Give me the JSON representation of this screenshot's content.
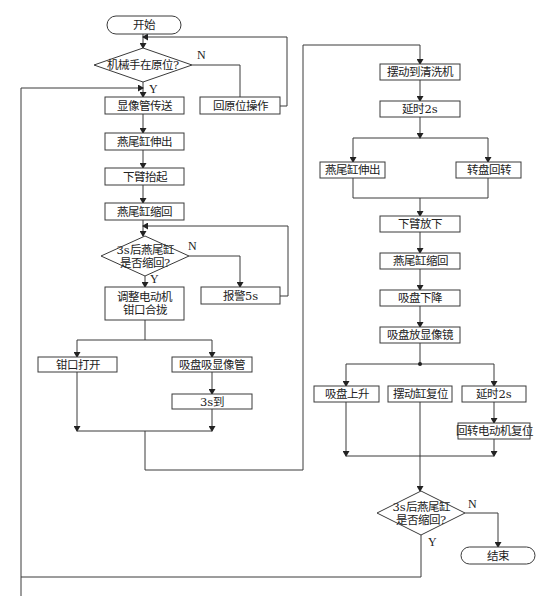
{
  "diagram": {
    "type": "flowchart",
    "colors": {
      "stroke": "#3a3a3a",
      "fill": "#ffffff",
      "text": "#222222"
    },
    "nodes": [
      {
        "id": "start",
        "shape": "terminal",
        "text": [
          "开始"
        ],
        "x": 107,
        "y": 16,
        "w": 74,
        "h": 18
      },
      {
        "id": "d1",
        "shape": "diamond",
        "text": [
          "机械手在原位?"
        ],
        "cx": 143,
        "cy": 65,
        "w": 98,
        "h": 34
      },
      {
        "id": "n_return",
        "shape": "rect",
        "text": [
          "回原位操作"
        ],
        "x": 200,
        "y": 97,
        "w": 80,
        "h": 17
      },
      {
        "id": "n1",
        "shape": "rect",
        "text": [
          "显像管传送"
        ],
        "x": 105,
        "y": 97,
        "w": 79,
        "h": 17
      },
      {
        "id": "n2",
        "shape": "rect",
        "text": [
          "燕尾缸伸出"
        ],
        "x": 105,
        "y": 133,
        "w": 79,
        "h": 17
      },
      {
        "id": "n3",
        "shape": "rect",
        "text": [
          "下臂抬起"
        ],
        "x": 105,
        "y": 168,
        "w": 79,
        "h": 17
      },
      {
        "id": "n4",
        "shape": "rect",
        "text": [
          "燕尾缸缩回"
        ],
        "x": 105,
        "y": 203,
        "w": 79,
        "h": 17
      },
      {
        "id": "d2",
        "shape": "diamond",
        "text": [
          "3s后燕尾缸",
          "是否缩回?"
        ],
        "cx": 145,
        "cy": 256,
        "w": 88,
        "h": 40
      },
      {
        "id": "n_alarm",
        "shape": "rect",
        "text": [
          "报警5s"
        ],
        "x": 201,
        "y": 287,
        "w": 79,
        "h": 17
      },
      {
        "id": "n5",
        "shape": "rect",
        "text": [
          "调整电动机",
          "钳口合拢"
        ],
        "x": 105,
        "y": 287,
        "w": 79,
        "h": 33
      },
      {
        "id": "n6",
        "shape": "rect",
        "text": [
          "钳口打开"
        ],
        "x": 38,
        "y": 357,
        "w": 79,
        "h": 15
      },
      {
        "id": "n7",
        "shape": "rect",
        "text": [
          "吸盘吸显像管"
        ],
        "x": 172,
        "y": 357,
        "w": 80,
        "h": 15
      },
      {
        "id": "n8",
        "shape": "rect",
        "text": [
          "3s到"
        ],
        "x": 172,
        "y": 394,
        "w": 80,
        "h": 15
      },
      {
        "id": "r1",
        "shape": "rect",
        "text": [
          "摆动到清洗机"
        ],
        "x": 380,
        "y": 64,
        "w": 80,
        "h": 16
      },
      {
        "id": "r2",
        "shape": "rect",
        "text": [
          "延时2s"
        ],
        "x": 380,
        "y": 101,
        "w": 80,
        "h": 16
      },
      {
        "id": "r3",
        "shape": "rect",
        "text": [
          "燕尾缸伸出"
        ],
        "x": 320,
        "y": 162,
        "w": 65,
        "h": 16
      },
      {
        "id": "r4",
        "shape": "rect",
        "text": [
          "转盘回转"
        ],
        "x": 456,
        "y": 162,
        "w": 65,
        "h": 16
      },
      {
        "id": "r5",
        "shape": "rect",
        "text": [
          "下臂放下"
        ],
        "x": 380,
        "y": 216,
        "w": 80,
        "h": 16
      },
      {
        "id": "r6",
        "shape": "rect",
        "text": [
          "燕尾缸缩回"
        ],
        "x": 380,
        "y": 253,
        "w": 80,
        "h": 16
      },
      {
        "id": "r7",
        "shape": "rect",
        "text": [
          "吸盘下降"
        ],
        "x": 380,
        "y": 290,
        "w": 80,
        "h": 16
      },
      {
        "id": "r8",
        "shape": "rect",
        "text": [
          "吸盘放显像镜"
        ],
        "x": 380,
        "y": 327,
        "w": 80,
        "h": 16
      },
      {
        "id": "r9",
        "shape": "rect",
        "text": [
          "吸盘上升"
        ],
        "x": 314,
        "y": 386,
        "w": 65,
        "h": 16
      },
      {
        "id": "r10",
        "shape": "rect",
        "text": [
          "摆动缸复位"
        ],
        "x": 388,
        "y": 386,
        "w": 64,
        "h": 16
      },
      {
        "id": "r11",
        "shape": "rect",
        "text": [
          "延时2s"
        ],
        "x": 462,
        "y": 386,
        "w": 64,
        "h": 16
      },
      {
        "id": "r12",
        "shape": "rect",
        "text": [
          "回转电动机复位"
        ],
        "x": 458,
        "y": 423,
        "w": 72,
        "h": 16
      },
      {
        "id": "d3",
        "shape": "diamond",
        "text": [
          "3s后燕尾缸",
          "是否缩回?"
        ],
        "cx": 421,
        "cy": 513,
        "w": 88,
        "h": 44
      },
      {
        "id": "end",
        "shape": "terminal",
        "text": [
          "结束"
        ],
        "x": 461,
        "y": 547,
        "w": 74,
        "h": 17
      }
    ],
    "branch_labels": [
      {
        "text": "N",
        "x": 197,
        "y": 59
      },
      {
        "text": "Y",
        "x": 149,
        "y": 93
      },
      {
        "text": "N",
        "x": 188,
        "y": 250
      },
      {
        "text": "Y",
        "x": 150,
        "y": 283
      },
      {
        "text": "N",
        "x": 468,
        "y": 508
      },
      {
        "text": "Y",
        "x": 428,
        "y": 546
      }
    ],
    "edges": [
      {
        "points": [
          [
            143,
            34
          ],
          [
            143,
            48
          ]
        ],
        "arrow": true
      },
      {
        "points": [
          [
            192,
            65
          ],
          [
            240,
            65
          ],
          [
            240,
            97
          ]
        ],
        "arrow": false
      },
      {
        "points": [
          [
            280,
            106
          ],
          [
            287,
            106
          ],
          [
            287,
            37
          ],
          [
            143,
            37
          ]
        ],
        "arrow": true
      },
      {
        "points": [
          [
            143,
            82
          ],
          [
            143,
            97
          ]
        ],
        "arrow": true
      },
      {
        "points": [
          [
            21,
            596
          ],
          [
            21,
            88
          ],
          [
            143,
            88
          ]
        ],
        "arrow": true,
        "note": "loop from final Y"
      },
      {
        "points": [
          [
            143,
            114
          ],
          [
            143,
            133
          ]
        ],
        "arrow": true
      },
      {
        "points": [
          [
            143,
            150
          ],
          [
            143,
            168
          ]
        ],
        "arrow": true
      },
      {
        "points": [
          [
            143,
            185
          ],
          [
            143,
            203
          ]
        ],
        "arrow": true
      },
      {
        "points": [
          [
            143,
            220
          ],
          [
            143,
            236
          ]
        ],
        "arrow": true
      },
      {
        "points": [
          [
            189,
            256
          ],
          [
            240,
            256
          ],
          [
            240,
            287
          ]
        ],
        "arrow": true
      },
      {
        "points": [
          [
            280,
            296
          ],
          [
            288,
            296
          ],
          [
            288,
            226
          ],
          [
            143,
            226
          ]
        ],
        "arrow": true
      },
      {
        "points": [
          [
            145,
            276
          ],
          [
            145,
            287
          ]
        ],
        "arrow": true
      },
      {
        "points": [
          [
            145,
            320
          ],
          [
            145,
            340
          ]
        ],
        "arrow": false
      },
      {
        "points": [
          [
            77,
            340
          ],
          [
            212,
            340
          ]
        ],
        "arrow": false
      },
      {
        "points": [
          [
            77,
            340
          ],
          [
            77,
            357
          ]
        ],
        "arrow": true
      },
      {
        "points": [
          [
            212,
            340
          ],
          [
            212,
            357
          ]
        ],
        "arrow": true
      },
      {
        "points": [
          [
            212,
            372
          ],
          [
            212,
            394
          ]
        ],
        "arrow": true
      },
      {
        "points": [
          [
            77,
            372
          ],
          [
            77,
            431
          ]
        ],
        "arrow": true
      },
      {
        "points": [
          [
            212,
            409
          ],
          [
            212,
            431
          ]
        ],
        "arrow": true
      },
      {
        "points": [
          [
            77,
            431
          ],
          [
            212,
            431
          ]
        ],
        "arrow": false
      },
      {
        "points": [
          [
            145,
            431
          ],
          [
            145,
            470
          ],
          [
            303,
            470
          ],
          [
            303,
            45
          ],
          [
            420,
            45
          ],
          [
            420,
            64
          ]
        ],
        "arrow": true
      },
      {
        "points": [
          [
            420,
            80
          ],
          [
            420,
            101
          ]
        ],
        "arrow": true
      },
      {
        "points": [
          [
            420,
            117
          ],
          [
            420,
            138
          ]
        ],
        "arrow": true
      },
      {
        "points": [
          [
            353,
            138
          ],
          [
            488,
            138
          ]
        ],
        "arrow": false
      },
      {
        "points": [
          [
            353,
            138
          ],
          [
            353,
            162
          ]
        ],
        "arrow": true
      },
      {
        "points": [
          [
            488,
            138
          ],
          [
            488,
            162
          ]
        ],
        "arrow": true
      },
      {
        "points": [
          [
            353,
            178
          ],
          [
            353,
            198
          ],
          [
            488,
            198
          ],
          [
            488,
            178
          ]
        ],
        "arrow": false
      },
      {
        "points": [
          [
            420,
            198
          ],
          [
            420,
            216
          ]
        ],
        "arrow": true
      },
      {
        "points": [
          [
            420,
            232
          ],
          [
            420,
            253
          ]
        ],
        "arrow": true
      },
      {
        "points": [
          [
            420,
            269
          ],
          [
            420,
            290
          ]
        ],
        "arrow": true
      },
      {
        "points": [
          [
            420,
            306
          ],
          [
            420,
            327
          ]
        ],
        "arrow": true
      },
      {
        "points": [
          [
            420,
            343
          ],
          [
            420,
            364
          ]
        ],
        "arrow": false
      },
      {
        "points": [
          [
            346,
            364
          ],
          [
            494,
            364
          ]
        ],
        "arrow": false
      },
      {
        "points": [
          [
            346,
            364
          ],
          [
            346,
            386
          ]
        ],
        "arrow": true
      },
      {
        "points": [
          [
            494,
            364
          ],
          [
            494,
            386
          ]
        ],
        "arrow": true
      },
      {
        "points": [
          [
            494,
            402
          ],
          [
            494,
            423
          ]
        ],
        "arrow": true
      },
      {
        "points": [
          [
            346,
            402
          ],
          [
            346,
            456
          ]
        ],
        "arrow": true
      },
      {
        "points": [
          [
            494,
            439
          ],
          [
            494,
            456
          ]
        ],
        "arrow": true
      },
      {
        "points": [
          [
            346,
            456
          ],
          [
            494,
            456
          ]
        ],
        "arrow": false
      },
      {
        "points": [
          [
            420,
            402
          ],
          [
            420,
            491
          ]
        ],
        "arrow": true
      },
      {
        "points": [
          [
            465,
            513
          ],
          [
            498,
            513
          ],
          [
            498,
            547
          ]
        ],
        "arrow": true
      },
      {
        "points": [
          [
            421,
            535
          ],
          [
            421,
            577
          ],
          [
            21,
            577
          ]
        ],
        "arrow": false
      }
    ],
    "junction_dots": [
      [
        420,
        364
      ]
    ]
  }
}
